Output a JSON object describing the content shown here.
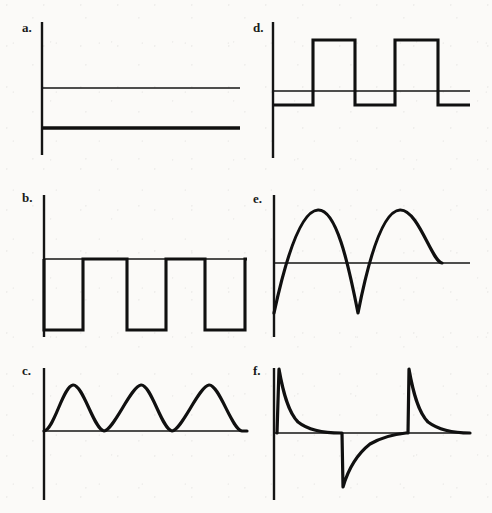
{
  "figure": {
    "title": "",
    "background_color": "#fbfaf8",
    "ink_color": "#101010",
    "panel_count": 6,
    "layout": "2 columns x 3 rows"
  },
  "panels": [
    {
      "id": "a",
      "label": "a.",
      "waveform_name": "dc-constant-signal",
      "description": "Constant DC level below the horizontal axis",
      "axis": {
        "origin_x": 42,
        "baseline_y": 88,
        "v_top": 22,
        "v_bottom": 155,
        "h_end": 240
      },
      "signal": {
        "level_y": 128,
        "x_start": 42,
        "x_end": 240
      }
    },
    {
      "id": "b",
      "label": "b.",
      "waveform_name": "square-wave-negative-offset",
      "description": "Square wave riding on the axis, pulses drop below baseline",
      "axis": {
        "origin_x": 44,
        "baseline_y": 259,
        "v_top": 195,
        "v_bottom": 337,
        "h_end": 247
      },
      "signal": {
        "high_y": 259,
        "low_y": 330,
        "transitions_x": [
          44,
          83,
          127,
          166,
          205,
          245
        ],
        "x_start": 44,
        "x_end": 247
      }
    },
    {
      "id": "c",
      "label": "c.",
      "waveform_name": "rectified-sine-positive-humps",
      "description": "Three positive half-sine humps touching the axis at the minima",
      "axis": {
        "origin_x": 44,
        "baseline_y": 431,
        "v_top": 368,
        "v_bottom": 500,
        "h_end": 247
      },
      "signal": {
        "peak_y": 385,
        "trough_y": 431,
        "peaks_x": [
          73,
          141,
          209
        ],
        "troughs_x": [
          44,
          104,
          172,
          240
        ],
        "x_start": 44,
        "x_end": 247,
        "cycles": 3
      }
    },
    {
      "id": "d",
      "label": "d.",
      "waveform_name": "square-wave-bipolar",
      "description": "Bipolar square wave, tall pulses above axis, shallow troughs below",
      "axis": {
        "origin_x": 273,
        "baseline_y": 91,
        "v_top": 22,
        "v_bottom": 158,
        "h_end": 470
      },
      "signal": {
        "high_y": 40,
        "low_y": 105,
        "transitions_x": [
          273,
          313,
          355,
          395,
          438,
          470
        ],
        "x_start": 273,
        "x_end": 470
      }
    },
    {
      "id": "e",
      "label": "e.",
      "waveform_name": "sine-wave",
      "description": "Two cycles of a sine wave starting at the negative minimum",
      "axis": {
        "origin_x": 274,
        "baseline_y": 263,
        "v_top": 195,
        "v_bottom": 337,
        "h_end": 470
      },
      "signal": {
        "peak_y": 210,
        "trough_y": 313,
        "peaks_x": [
          318,
          400
        ],
        "troughs_x": [
          274,
          358
        ],
        "x_start": 274,
        "x_end": 442,
        "cycles": 2
      }
    },
    {
      "id": "f",
      "label": "f.",
      "waveform_name": "exponential-decay-spikes",
      "description": "Positive exponential decay spike, negative decay spike, then a second positive spike",
      "axis": {
        "origin_x": 274,
        "baseline_y": 433,
        "v_top": 368,
        "v_bottom": 500,
        "h_end": 470
      },
      "signal": {
        "positive_peak_y": 368,
        "negative_peak_y": 487,
        "spikes_x": [
          279,
          342,
          408
        ],
        "spike_polarity": [
          "positive",
          "negative",
          "positive"
        ],
        "x_start": 274,
        "x_end": 470
      }
    }
  ]
}
